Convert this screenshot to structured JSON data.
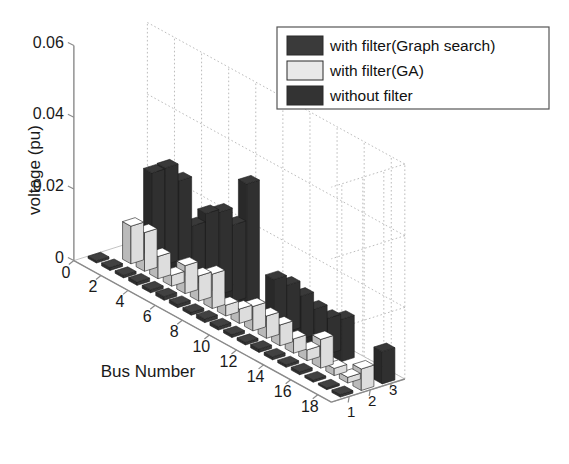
{
  "figure": {
    "background": "#ffffff",
    "axis_color": "#8a8a8a",
    "grid_color": "#b4b4b4"
  },
  "legend": {
    "border_color": "#555555",
    "items": [
      {
        "label": "with filter(Graph search)",
        "color": "#3a3a3a",
        "swatch_name": "legend-swatch-graph-search"
      },
      {
        "label": "with filter(GA)",
        "color": "#e9e9e9",
        "swatch_name": "legend-swatch-ga"
      },
      {
        "label": "without filter",
        "color": "#333333",
        "swatch_name": "legend-swatch-without-filter"
      }
    ]
  },
  "chart_data": {
    "type": "bar",
    "title": "",
    "subtitle": "",
    "xlabel": "Bus Number",
    "ylabel": "voltage (pu)",
    "zlabel": "",
    "projection": "3d-bar3",
    "grid": true,
    "legend_position": "top-right",
    "ylim": [
      0,
      0.06
    ],
    "ytick_labels": [
      "0",
      "0.02",
      "0.04",
      "0.06"
    ],
    "ytick_values": [
      0,
      0.02,
      0.04,
      0.06
    ],
    "xtick_labels": [
      "0",
      "2",
      "4",
      "6",
      "8",
      "10",
      "12",
      "14",
      "16",
      "18"
    ],
    "xtick_values": [
      0,
      2,
      4,
      6,
      8,
      10,
      12,
      14,
      16,
      18
    ],
    "ztick_labels": [
      "1",
      "2",
      "3"
    ],
    "ztick_values": [
      1,
      2,
      3
    ],
    "categories": [
      1,
      2,
      3,
      4,
      5,
      6,
      7,
      8,
      9,
      10,
      11,
      12,
      13,
      14,
      15,
      16,
      17,
      18,
      19
    ],
    "series": [
      {
        "name": "with filter(Graph search)",
        "z": 1,
        "color": "#3a3a3a",
        "values": [
          0.0006,
          0.0008,
          0.0007,
          0.0009,
          0.0008,
          0.001,
          0.0009,
          0.0008,
          0.001,
          0.0009,
          0.0008,
          0.0007,
          0.0009,
          0.0008,
          0.0007,
          0.0008,
          0.0006,
          0.0005,
          0.0007
        ]
      },
      {
        "name": "with filter(GA)",
        "z": 2,
        "color": "#e9e9e9",
        "values": [
          0.0,
          0.0105,
          0.0108,
          0.0062,
          0.003,
          0.0078,
          0.007,
          0.0096,
          0.003,
          0.004,
          0.0068,
          0.0062,
          0.0058,
          0.004,
          0.003,
          0.008,
          0.002,
          0.0016,
          0.006
        ]
      },
      {
        "name": "without filter",
        "z": 3,
        "color": "#333333",
        "values": [
          0.0,
          0.0235,
          0.027,
          0.0255,
          0.015,
          0.0205,
          0.023,
          0.0215,
          0.035,
          0.0,
          0.0125,
          0.013,
          0.012,
          0.0105,
          0.01,
          0.0118,
          0.0,
          0.0,
          0.009
        ]
      }
    ]
  }
}
